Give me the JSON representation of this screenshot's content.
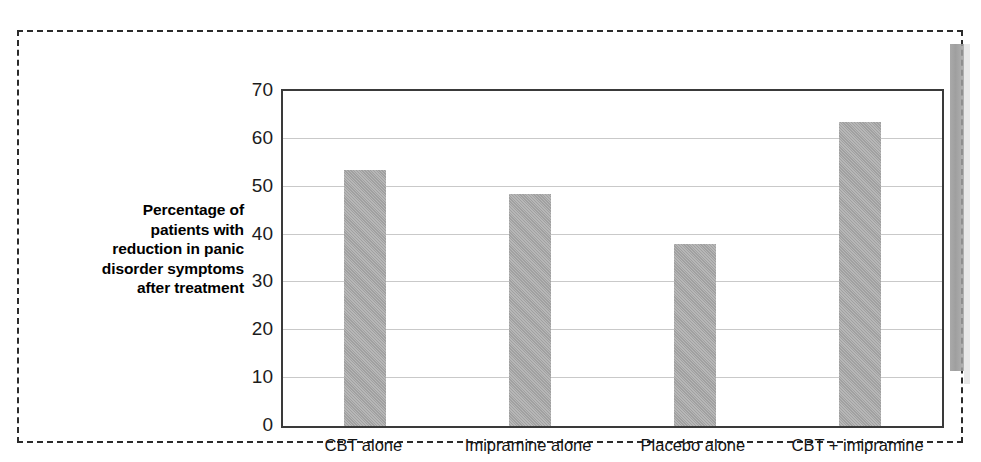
{
  "figure": {
    "border_style": "dashed",
    "border_color": "#2b2b2b",
    "background": "#ffffff"
  },
  "artifact": {
    "name": "page-edge-scan-artifact",
    "color": "#9a9a9a"
  },
  "chart_data": {
    "type": "bar",
    "title": "",
    "categories": [
      "CBT alone",
      "Imipramine alone",
      "Placebo alone",
      "CBT + imipramine"
    ],
    "values": [
      53.5,
      48.5,
      38,
      63.5
    ],
    "xlabel": "",
    "ylabel": "Percentage of patients with reduction in panic disorder symptoms after treatment",
    "ylim": [
      0,
      70
    ],
    "ytick_values": [
      0,
      10,
      20,
      30,
      40,
      50,
      60,
      70
    ],
    "ytick_labels": [
      "0",
      "10",
      "20",
      "30",
      "40",
      "50",
      "60",
      "70"
    ],
    "grid": true,
    "grid_color": "#c9c9c9",
    "legend": false,
    "bar_color": "#a9a9a9",
    "axis_color": "#3a3a3a"
  },
  "y_axis_title_lines": [
    "Percentage of",
    "patients with",
    "reduction in panic",
    "disorder symptoms",
    "after treatment"
  ]
}
